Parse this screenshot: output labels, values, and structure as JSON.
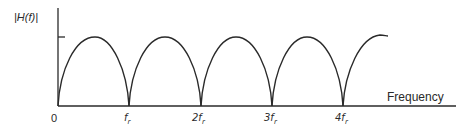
{
  "diagram": {
    "type": "frequency-response-plot",
    "y_axis_label": "|H(f)|",
    "x_axis_label": "Frequency",
    "origin_label": "0",
    "x_ticks": [
      {
        "label": "f",
        "sub": "r"
      },
      {
        "label": "2f",
        "sub": "r"
      },
      {
        "label": "3f",
        "sub": "r"
      },
      {
        "label": "4f",
        "sub": "r"
      }
    ],
    "curve": "full-wave rectified sine (|sin|) with zeros at multiples of f_r, peak marked by tick on y-axis",
    "colors": {
      "line": "#2a2a2a",
      "background": "#ffffff"
    }
  }
}
